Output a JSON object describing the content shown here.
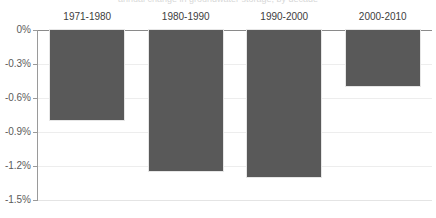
{
  "title_sliver": "annual change in groundwater storage, by decade",
  "colors": {
    "bar": "#595959",
    "gridline": "#ededed",
    "axis": "#8a8a8a",
    "background": "#ffffff",
    "label_text": "#3d3d3d",
    "tick_text": "#5b5b5b"
  },
  "chart_data": {
    "type": "bar",
    "title": "",
    "xlabel": "",
    "ylabel": "",
    "categories": [
      "1971-1980",
      "1980-1990",
      "1990-2000",
      "2000-2010"
    ],
    "values": [
      -0.79,
      -1.24,
      -1.3,
      -0.49
    ],
    "value_labels": [
      "-0.79%",
      "-1.24%",
      "-1.30%",
      "-0.49%"
    ],
    "ylim": [
      -1.5,
      0
    ],
    "ytick_values": [
      0,
      -0.3,
      -0.6,
      -0.9,
      -1.2,
      -1.5
    ],
    "ytick_labels": [
      "0%",
      "-0.3%",
      "-0.6%",
      "-0.9%",
      "-1.2%",
      "-1.5%"
    ],
    "grid": true,
    "legend": false,
    "legend_position": "none",
    "category_label_position": "above-baseline",
    "series": [
      {
        "name": "change",
        "values": [
          -0.79,
          -1.24,
          -1.3,
          -0.49
        ]
      }
    ]
  }
}
